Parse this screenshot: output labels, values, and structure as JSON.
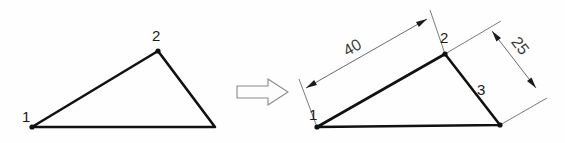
{
  "figure": {
    "background_color": "#fefefe",
    "line_color": "#111111",
    "dimension_color": "#5a5a5a",
    "arrow_fill": "#fdfdfd",
    "arrow_stroke": "#8a8a8a"
  },
  "left_shape": {
    "name": "undimensioned-triangle",
    "vertices": [
      {
        "id": "1",
        "label": "1",
        "x": 32,
        "y": 127,
        "label_x": 22,
        "label_y": 122
      },
      {
        "id": "2",
        "label": "2",
        "x": 158,
        "y": 51,
        "label_x": 152,
        "label_y": 41
      },
      {
        "id": "3",
        "label": "",
        "x": 215,
        "y": 127,
        "label_x": 0,
        "label_y": 0
      }
    ],
    "path": "M 32 127 L 158 51 L 215 127 Z"
  },
  "transition": {
    "name": "block-arrow",
    "direction": "right",
    "path": "M 237 86 L 268 86 L 268 79 L 288 92 L 268 105 L 268 98 L 237 98 Z"
  },
  "right_shape": {
    "name": "dimensioned-triangle",
    "vertices": [
      {
        "id": "1",
        "label": "1",
        "x": 317,
        "y": 127,
        "label_x": 309,
        "label_y": 120
      },
      {
        "id": "2",
        "label": "2",
        "x": 445,
        "y": 54,
        "label_x": 440,
        "label_y": 43
      },
      {
        "id": "3",
        "label": "3",
        "x": 500,
        "y": 125,
        "label_x": 477,
        "label_y": 95
      }
    ],
    "path": "M 317 127 L 445 54 L 500 125 Z"
  },
  "dimensions": [
    {
      "name": "dimension-40",
      "value": "40",
      "measures": "side 1 to 2",
      "label_x": 355,
      "label_y": 52,
      "label_rotation": -29.7,
      "dim_line": {
        "x1": 306,
        "y1": 88,
        "x2": 427,
        "y2": 19
      },
      "ext_line_1": {
        "x1": 317,
        "y1": 127,
        "x2": 299,
        "y2": 79
      },
      "ext_line_2": {
        "x1": 445,
        "y1": 54,
        "x2": 430,
        "y2": 10
      }
    },
    {
      "name": "dimension-25",
      "value": "25",
      "measures": "side 2 to 3",
      "label_x": 516,
      "label_y": 49,
      "label_rotation": 52.2,
      "dim_line": {
        "x1": 492,
        "y1": 31,
        "x2": 536,
        "y2": 88
      },
      "ext_line_1": {
        "x1": 445,
        "y1": 54,
        "x2": 501,
        "y2": 21
      },
      "ext_line_2": {
        "x1": 500,
        "y1": 125,
        "x2": 547,
        "y2": 98
      }
    }
  ]
}
